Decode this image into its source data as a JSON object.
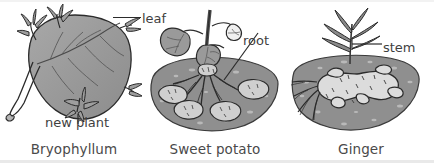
{
  "figure": {
    "background_color": "#ffffff",
    "ink_color": "#2b2b2b",
    "soil_color": "#8f8f8f",
    "leaf_color": "#9a9a9a",
    "tuber_color": "#c9c9c9"
  },
  "panels": [
    {
      "id": "bryophyllum",
      "caption": "Bryophyllum",
      "annotations": [
        {
          "id": "leaf",
          "label": "leaf"
        },
        {
          "id": "new-plant",
          "label": "new plant"
        }
      ]
    },
    {
      "id": "sweet-potato",
      "caption": "Sweet potato",
      "annotations": [
        {
          "id": "root",
          "label": "root"
        }
      ]
    },
    {
      "id": "ginger",
      "caption": "Ginger",
      "annotations": [
        {
          "id": "stem",
          "label": "stem"
        }
      ]
    }
  ]
}
